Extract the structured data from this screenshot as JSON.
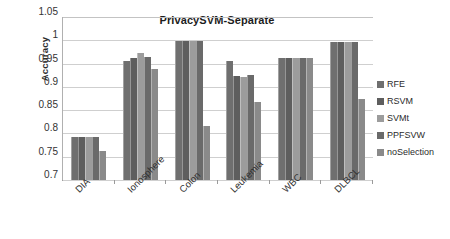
{
  "chart_data": {
    "type": "bar",
    "title": "PrivacySVM-Separate",
    "xlabel": "",
    "ylabel": "Accuracy",
    "ylim": [
      0.7,
      1.05
    ],
    "yticks": [
      "1.05",
      "1",
      "0.95",
      "0.9",
      "0.85",
      "0.8",
      "0.75",
      "0.7"
    ],
    "ytick_values": [
      1.05,
      1.0,
      0.95,
      0.9,
      0.85,
      0.8,
      0.75,
      0.7
    ],
    "grid": true,
    "legend_position": "right",
    "categories": [
      "DIA",
      "Ionosphere",
      "Colon",
      "Leukemia",
      "WBC",
      "DLBCL"
    ],
    "series": [
      {
        "name": "RFE",
        "color": "#6f6f6f",
        "values": [
          0.793,
          0.955,
          0.998,
          0.955,
          0.963,
          0.997
        ]
      },
      {
        "name": "RSVM",
        "color": "#5e5e5e",
        "values": [
          0.793,
          0.962,
          0.998,
          0.924,
          0.963,
          0.997
        ]
      },
      {
        "name": "SVMt",
        "color": "#9c9c9c",
        "values": [
          0.793,
          0.973,
          0.998,
          0.922,
          0.962,
          0.997
        ]
      },
      {
        "name": "PPFSVW",
        "color": "#6a6a6a",
        "values": [
          0.793,
          0.965,
          0.998,
          0.926,
          0.963,
          0.997
        ]
      },
      {
        "name": "noSelection",
        "color": "#8a8a8a",
        "values": [
          0.763,
          0.938,
          0.815,
          0.868,
          0.963,
          0.873
        ]
      }
    ]
  },
  "legend": {
    "items": [
      {
        "label": "RFE",
        "color": "#6f6f6f"
      },
      {
        "label": "RSVM",
        "color": "#5e5e5e"
      },
      {
        "label": "SVMt",
        "color": "#9c9c9c"
      },
      {
        "label": "PPFSVW",
        "color": "#6a6a6a"
      },
      {
        "label": "noSelection",
        "color": "#8a8a8a"
      }
    ]
  },
  "colors": {
    "background": "#ffffff",
    "gridline": "#cfcfcf",
    "axis": "#8d8d8d",
    "text": "#2f2f2f"
  }
}
